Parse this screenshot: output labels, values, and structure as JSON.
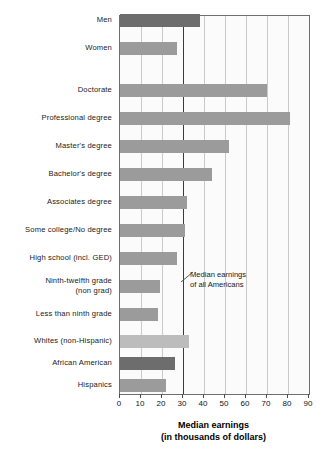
{
  "chart_data": {
    "type": "bar",
    "orientation": "horizontal",
    "title": "",
    "xlabel": "Median earnings (in thousands of dollars)",
    "xlabel_line1": "Median earnings",
    "xlabel_line2": "(in thousands of dollars)",
    "ylabel": "",
    "xlim": [
      0,
      90
    ],
    "xticks": [
      0,
      10,
      20,
      30,
      40,
      50,
      60,
      70,
      80,
      90
    ],
    "xtick_labels": [
      "0",
      "10",
      "20",
      "30",
      "40",
      "50",
      "60",
      "70",
      "80",
      "90"
    ],
    "grid": "vertical",
    "legend": "none",
    "annotations": [
      {
        "name": "median-reference-line",
        "text_line1": "Median earnings",
        "text_line2": "of all Americans",
        "value": 30
      }
    ],
    "categories": [
      "Men",
      "Women",
      "Doctorate",
      "Professional degree",
      "Master's degree",
      "Bachelor's degree",
      "Associates degree",
      "Some college/No degree",
      "High school (incl. GED)",
      "Ninth-twelfth grade (non grad)",
      "Less than ninth grade",
      "Whites (non-Hispanic)",
      "African American",
      "Hispanics"
    ],
    "values": [
      38,
      27,
      70,
      81,
      52,
      44,
      32,
      31,
      27,
      19,
      18,
      33,
      26,
      22
    ],
    "bars": [
      {
        "label": "Men",
        "label_line2": "",
        "value": 38,
        "shade": "dark",
        "group": "gender"
      },
      {
        "label": "Women",
        "label_line2": "",
        "value": 27,
        "shade": "mid",
        "group": "gender"
      },
      {
        "label": "Doctorate",
        "label_line2": "",
        "value": 70,
        "shade": "mid",
        "group": "education"
      },
      {
        "label": "Professional degree",
        "label_line2": "",
        "value": 81,
        "shade": "mid",
        "group": "education"
      },
      {
        "label": "Master's degree",
        "label_line2": "",
        "value": 52,
        "shade": "mid",
        "group": "education"
      },
      {
        "label": "Bachelor's degree",
        "label_line2": "",
        "value": 44,
        "shade": "mid",
        "group": "education"
      },
      {
        "label": "Associates degree",
        "label_line2": "",
        "value": 32,
        "shade": "mid",
        "group": "education"
      },
      {
        "label": "Some college/No degree",
        "label_line2": "",
        "value": 31,
        "shade": "mid",
        "group": "education"
      },
      {
        "label": "High school (incl. GED)",
        "label_line2": "",
        "value": 27,
        "shade": "mid",
        "group": "education"
      },
      {
        "label": "Ninth-twelfth grade",
        "label_line2": "(non grad)",
        "value": 19,
        "shade": "mid",
        "group": "education"
      },
      {
        "label": "Less than ninth grade",
        "label_line2": "",
        "value": 18,
        "shade": "mid",
        "group": "education"
      },
      {
        "label": "Whites (non-Hispanic)",
        "label_line2": "",
        "value": 33,
        "shade": "light",
        "group": "race"
      },
      {
        "label": "African American",
        "label_line2": "",
        "value": 26,
        "shade": "dark",
        "group": "race"
      },
      {
        "label": "Hispanics",
        "label_line2": "",
        "value": 22,
        "shade": "mid",
        "group": "race"
      }
    ],
    "colors": {
      "dark": "#6d6d6d",
      "mid": "#9b9b9b",
      "light": "#bcbcbc",
      "gridline": "#c9c9c9",
      "median_line": "#3a3a3a",
      "axis": "#6e6e6e",
      "plot_background": "#fbfbfb",
      "text": "#1a1a1a"
    }
  }
}
